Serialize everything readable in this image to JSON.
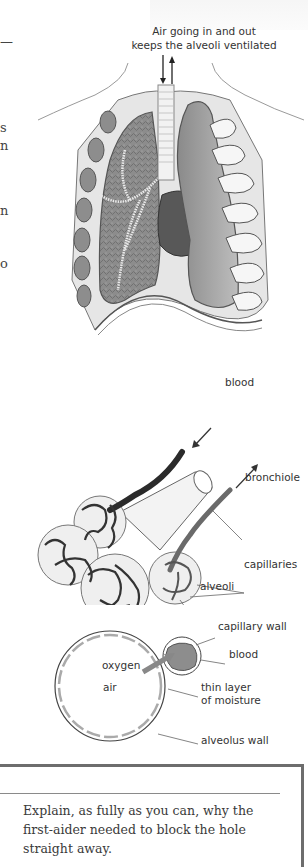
{
  "page": {
    "left_margin_fragments": [
      "—",
      "s",
      "n",
      "n",
      "o"
    ],
    "lungs_figure": {
      "caption_line1": "Air going in and out",
      "caption_line2": "keeps the alveoli ventilated"
    },
    "alveoli_figure": {
      "labels": {
        "blood": "blood",
        "bronchiole": "bronchiole",
        "capillaries": "capillaries",
        "alveoli": "alveoli"
      }
    },
    "gas_exchange_figure": {
      "labels": {
        "capillary_wall": "capillary wall",
        "blood": "blood",
        "oxygen": "oxygen",
        "air": "air",
        "moisture_line1": "thin layer",
        "moisture_line2": "of moisture",
        "alveolus_wall": "alveolus wall"
      }
    },
    "question_box": {
      "question": "Explain, as fully as you can, why the first-aider needed to block the hole straight away."
    },
    "colors": {
      "border": "#6d6d6d",
      "text": "#333333",
      "dark_vessel": "#2b2b2b",
      "mid_vessel": "#6a6a6a",
      "lung_tissue": "#9a9a9a"
    }
  }
}
